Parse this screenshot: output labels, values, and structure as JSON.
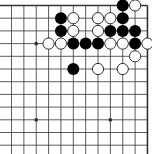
{
  "diagram": {
    "columns": 12,
    "rows": 12,
    "edges": [
      "top",
      "right"
    ],
    "colors": {
      "background": "#ffffff",
      "line": "#333333",
      "black_stone": "#000000",
      "white_stone_fill": "#ffffff",
      "white_stone_outline": "#000000"
    },
    "star_points": [
      {
        "col": 2,
        "row": 3
      },
      {
        "col": 2,
        "row": 9
      },
      {
        "col": 8,
        "row": 9
      }
    ],
    "black_stones": [
      {
        "col": 9,
        "row": 0
      },
      {
        "col": 4,
        "row": 1
      },
      {
        "col": 9,
        "row": 1
      },
      {
        "col": 4,
        "row": 2
      },
      {
        "col": 8,
        "row": 2
      },
      {
        "col": 9,
        "row": 2
      },
      {
        "col": 10,
        "row": 2
      },
      {
        "col": 5,
        "row": 3
      },
      {
        "col": 6,
        "row": 3
      },
      {
        "col": 7,
        "row": 3
      },
      {
        "col": 10,
        "row": 3
      },
      {
        "col": 5,
        "row": 5
      }
    ],
    "white_stones": [
      {
        "col": 10,
        "row": 0
      },
      {
        "col": 5,
        "row": 1
      },
      {
        "col": 7,
        "row": 1
      },
      {
        "col": 8,
        "row": 1
      },
      {
        "col": 5,
        "row": 2
      },
      {
        "col": 7,
        "row": 2
      },
      {
        "col": 3,
        "row": 3
      },
      {
        "col": 4,
        "row": 3
      },
      {
        "col": 8,
        "row": 3
      },
      {
        "col": 9,
        "row": 3
      },
      {
        "col": 11,
        "row": 3
      },
      {
        "col": 10,
        "row": 4
      },
      {
        "col": 7,
        "row": 5
      },
      {
        "col": 9,
        "row": 5
      }
    ]
  }
}
